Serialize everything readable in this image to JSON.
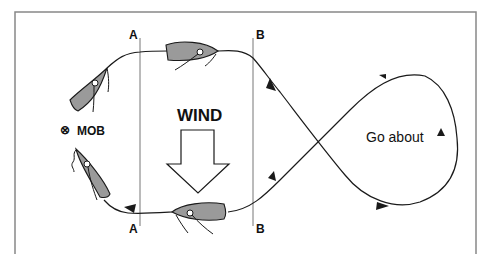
{
  "diagram": {
    "labels": {
      "a_top": "A",
      "a_bottom": "A",
      "b_top": "B",
      "b_bottom": "B",
      "wind": "WIND",
      "mob": "MOB",
      "mob_symbol": "⊗",
      "go_about": "Go about"
    },
    "colors": {
      "line": "#1a1a1a",
      "frame": "#888888",
      "hull": "#9a9a9a",
      "guide_lines": "#777777"
    }
  }
}
